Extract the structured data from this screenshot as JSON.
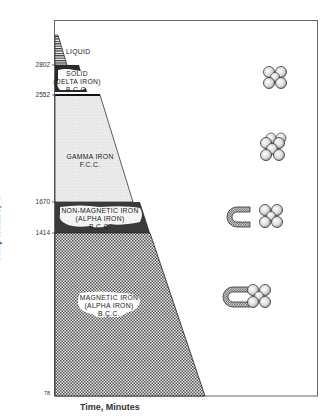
{
  "diagram": {
    "axes": {
      "y_label": "Temperature, °F",
      "x_label": "Time, Minutes",
      "y_ticks": [
        "2802",
        "2552",
        "1670",
        "1414",
        "78"
      ]
    },
    "regions": [
      {
        "id": "liquid",
        "label_lines": [
          "LIQUID"
        ],
        "temp_range": "above 2802",
        "pattern": "horizontal-lines"
      },
      {
        "id": "delta",
        "label_lines": [
          "SOLID",
          "(DELTA IRON)",
          "B.C.C."
        ],
        "temp_range": "2802-2552",
        "pattern": "dark"
      },
      {
        "id": "gamma",
        "label_lines": [
          "GAMMA IRON",
          "F.C.C."
        ],
        "temp_range": "2552-1670",
        "pattern": "light-stipple"
      },
      {
        "id": "non_magnetic",
        "label_lines": [
          "NON-MAGNETIC IRON",
          "(ALPHA IRON)",
          "B.C.C."
        ],
        "temp_range": "1670-1414",
        "pattern": "dark"
      },
      {
        "id": "magnetic",
        "label_lines": [
          "MAGNETIC IRON",
          "(ALPHA IRON)",
          "B.C.C."
        ],
        "temp_range": "1414-78",
        "pattern": "checker"
      }
    ],
    "icons": [
      {
        "name": "bcc-atom-cluster-delta",
        "type": "atom-cluster"
      },
      {
        "name": "fcc-atom-cluster-gamma",
        "type": "atom-cluster"
      },
      {
        "name": "magnet-away-bcc-cluster",
        "type": "magnet-with-cluster"
      },
      {
        "name": "magnet-attached-bcc-cluster",
        "type": "magnet-with-cluster"
      }
    ],
    "colors": {
      "frame": "#555555",
      "dark_band": "#2a2a2a",
      "gamma_fill": "#e6e6e6",
      "atom_fill": "#dcdcdc",
      "atom_stroke": "#333333"
    }
  }
}
